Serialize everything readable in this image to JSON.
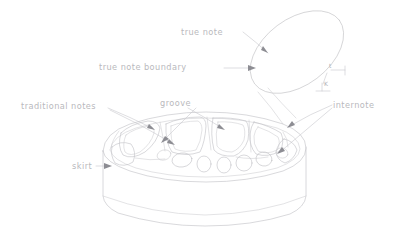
{
  "figure": {
    "type": "technical-line-drawing",
    "title": "",
    "background_color": "#ffffff",
    "line_color": "#c2c2c6",
    "text_color": "#b9b9bd",
    "arrow_color": "#8d8d93",
    "width": 406,
    "height": 232
  },
  "labels": {
    "true_note": "true note",
    "true_note_boundary": "true note boundary",
    "traditional_notes": "traditional notes",
    "groove": "groove",
    "internote": "internote",
    "skirt": "skirt",
    "t_symbol": "t",
    "k_symbol": "K"
  },
  "parts": [
    {
      "name": "true-note",
      "label": "true note",
      "description": "tilted ellipse above the disc"
    },
    {
      "name": "true-note-boundary",
      "label": "true note boundary",
      "description": "outline of the tilted ellipse"
    },
    {
      "name": "traditional-notes",
      "label": "traditional notes",
      "description": "honeycomb cells on the top surface"
    },
    {
      "name": "groove",
      "label": "groove",
      "description": "channel between cells on the top surface"
    },
    {
      "name": "internote",
      "label": "internote",
      "description": "material between adjacent notes"
    },
    {
      "name": "skirt",
      "label": "skirt",
      "description": "cylindrical side wall of the disc"
    }
  ]
}
